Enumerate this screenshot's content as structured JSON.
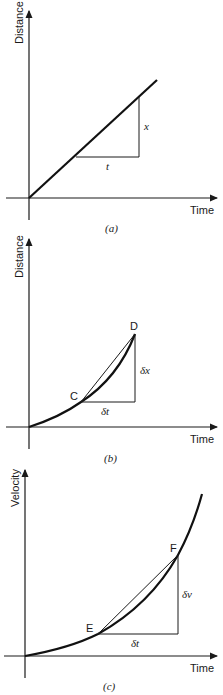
{
  "figure": {
    "panels": [
      {
        "id": "a",
        "caption": "(a)",
        "y_axis_label": "Distance",
        "x_axis_label": "Time",
        "curve": "straight line",
        "triangle": {
          "horizontal_label": "t",
          "vertical_label": "x"
        }
      },
      {
        "id": "b",
        "caption": "(b)",
        "y_axis_label": "Distance",
        "x_axis_label": "Time",
        "curve": "increasing convex curve",
        "points": [
          "C",
          "D"
        ],
        "triangle": {
          "horizontal_label": "δt",
          "vertical_label": "δx"
        }
      },
      {
        "id": "c",
        "caption": "(c)",
        "y_axis_label": "Velocity",
        "x_axis_label": "Time",
        "curve": "increasing convex curve",
        "points": [
          "E",
          "F"
        ],
        "triangle": {
          "horizontal_label": "δt",
          "vertical_label": "δv"
        }
      }
    ]
  }
}
